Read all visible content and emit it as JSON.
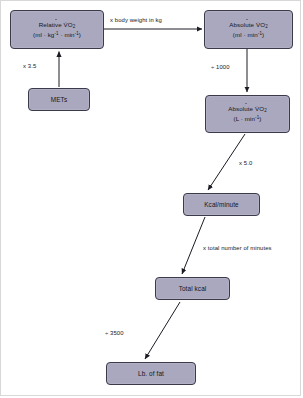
{
  "diagram": {
    "colors": {
      "node_fill": "#a9a8be",
      "node_border": "#3a3a4a",
      "arrow": "#1b1b24",
      "text": "#15151c",
      "frame": "#d8d8d8",
      "background": "#ffffff"
    },
    "nodes": [
      {
        "id": "relative-vo2",
        "line1": "Relative V̇O",
        "line1_sub": "2",
        "line2_prefix": "(ml · kg",
        "line2_sup1": "-1",
        "line2_mid": " · min",
        "line2_sup2": "-1",
        "line2_suffix": ")"
      },
      {
        "id": "absolute-vo2-ml",
        "line1": "Absolute V̇O",
        "line1_sub": "2",
        "line2_prefix": "(ml · min",
        "line2_sup1": "-1",
        "line2_suffix": ")"
      },
      {
        "id": "mets",
        "line1": "METs"
      },
      {
        "id": "absolute-vo2-l",
        "line1": "Absolute V̇O",
        "line1_sub": "2",
        "line2_prefix": "(L · min",
        "line2_sup1": "-1",
        "line2_suffix": ")"
      },
      {
        "id": "kcal-minute",
        "line1": "Kcal/minute"
      },
      {
        "id": "total-kcal",
        "line1": "Total kcal"
      },
      {
        "id": "lb-of-fat",
        "line1": "Lb. of fat"
      }
    ],
    "edges": [
      {
        "id": "mets-to-relative",
        "from": "mets",
        "to": "relative-vo2",
        "label": "x 3.5"
      },
      {
        "id": "relative-to-absolute-ml",
        "from": "relative-vo2",
        "to": "absolute-vo2-ml",
        "label": "x body weight in kg"
      },
      {
        "id": "absolute-ml-to-absolute-l",
        "from": "absolute-vo2-ml",
        "to": "absolute-vo2-l",
        "label": "÷ 1000"
      },
      {
        "id": "absolute-l-to-kcal-minute",
        "from": "absolute-vo2-l",
        "to": "kcal-minute",
        "label": "x 5.0"
      },
      {
        "id": "kcal-minute-to-total-kcal",
        "from": "kcal-minute",
        "to": "total-kcal",
        "label": "x total number of minutes"
      },
      {
        "id": "total-kcal-to-lb-of-fat",
        "from": "total-kcal",
        "to": "lb-of-fat",
        "label": "÷ 3500"
      }
    ]
  }
}
